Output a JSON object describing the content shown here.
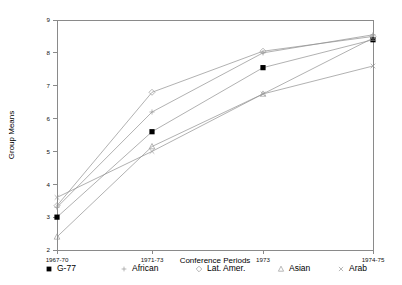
{
  "chart_data": {
    "type": "line",
    "title": "",
    "xlabel": "Conference Periods",
    "ylabel": "Group Means",
    "categories": [
      "1967-70",
      "1971-73",
      "1973",
      "1974-75"
    ],
    "ylim": [
      2,
      9
    ],
    "yticks": [
      2,
      3,
      4,
      5,
      6,
      7,
      8,
      9
    ],
    "ytick_labels": [
      "2",
      "3",
      "4",
      "5",
      "6",
      "7",
      "8",
      "9"
    ],
    "grid": false,
    "legend_position": "bottom",
    "series": [
      {
        "name": "G-77",
        "marker": "filled-square",
        "values": [
          3.0,
          5.6,
          7.55,
          8.4
        ]
      },
      {
        "name": "African",
        "marker": "plus",
        "values": [
          3.3,
          6.2,
          8.0,
          8.55
        ]
      },
      {
        "name": "Lat. Amer.",
        "marker": "diamond",
        "values": [
          3.35,
          6.8,
          8.05,
          8.5
        ]
      },
      {
        "name": "Asian",
        "marker": "triangle",
        "values": [
          2.4,
          5.15,
          6.75,
          8.45
        ]
      },
      {
        "name": "Arab",
        "marker": "cross",
        "values": [
          3.6,
          5.0,
          6.75,
          7.6
        ]
      }
    ]
  },
  "axes": {
    "y_title": "Group Means",
    "x_title": "Conference Periods",
    "y_tick_labels": [
      "9",
      "8",
      "7",
      "6",
      "5",
      "4",
      "3",
      "2"
    ],
    "x_tick_labels": [
      "1967-70",
      "1971-73",
      "1973",
      "1974-75"
    ]
  },
  "legend": {
    "items": [
      {
        "label": "G-77",
        "marker": "filled-square"
      },
      {
        "label": "African",
        "marker": "plus"
      },
      {
        "label": "Lat. Amer.",
        "marker": "diamond"
      },
      {
        "label": "Asian",
        "marker": "triangle"
      },
      {
        "label": "Arab",
        "marker": "cross"
      }
    ]
  },
  "colors": {
    "background": "#ffffff",
    "axis": "#8a8a8a",
    "line": "#8f8f8f",
    "marker_filled": "#000000",
    "marker_open": "#9a9a9a",
    "text": "#000000"
  }
}
